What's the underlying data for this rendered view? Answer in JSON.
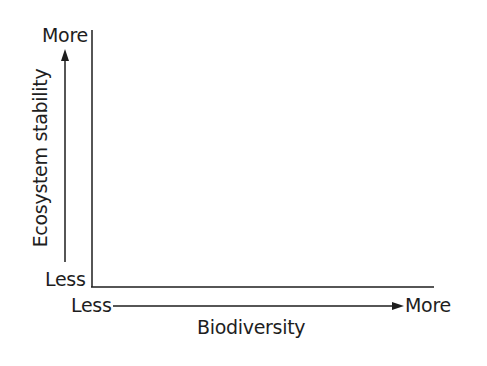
{
  "diagram": {
    "type": "blank axes template",
    "y_axis": {
      "title": "Ecosystem stability",
      "high_label": "More",
      "low_label": "Less"
    },
    "x_axis": {
      "title": "Biodiversity",
      "low_label": "Less",
      "high_label": "More"
    },
    "line_color": "#1e1e1e"
  }
}
